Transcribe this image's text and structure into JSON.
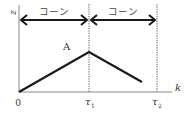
{
  "diagram": {
    "axes": {
      "y_label": "z",
      "x_label": "k",
      "origin_label": "0"
    },
    "ticks": [
      {
        "label": "τ",
        "sub": "1"
      },
      {
        "label": "τ",
        "sub": "2"
      }
    ],
    "intervals": [
      {
        "label": "コーン"
      },
      {
        "label": "コーン"
      }
    ],
    "point_label": "A",
    "colors": {
      "line": "#1a1a1a",
      "axis": "#777777",
      "dotted": "#555555"
    }
  }
}
